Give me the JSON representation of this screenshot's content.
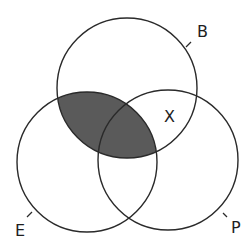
{
  "diagram": {
    "type": "venn-3-set",
    "colors": {
      "stroke": "#2a2a2a",
      "shade": "#5a5a5a",
      "background": "#ffffff",
      "text": "#1e1e1e"
    },
    "sets": [
      {
        "id": "B",
        "label": "B",
        "cx": 127,
        "cy": 88,
        "r": 70
      },
      {
        "id": "E",
        "label": "E",
        "cx": 87,
        "cy": 162,
        "r": 70
      },
      {
        "id": "P",
        "label": "P",
        "cx": 168,
        "cy": 160,
        "r": 70
      }
    ],
    "shaded_region": {
      "description": "Intersection of B and E (B ∩ E)",
      "sets": [
        "B",
        "E"
      ]
    },
    "marker": {
      "label": "X",
      "region": "B ∩ P outside E"
    }
  }
}
